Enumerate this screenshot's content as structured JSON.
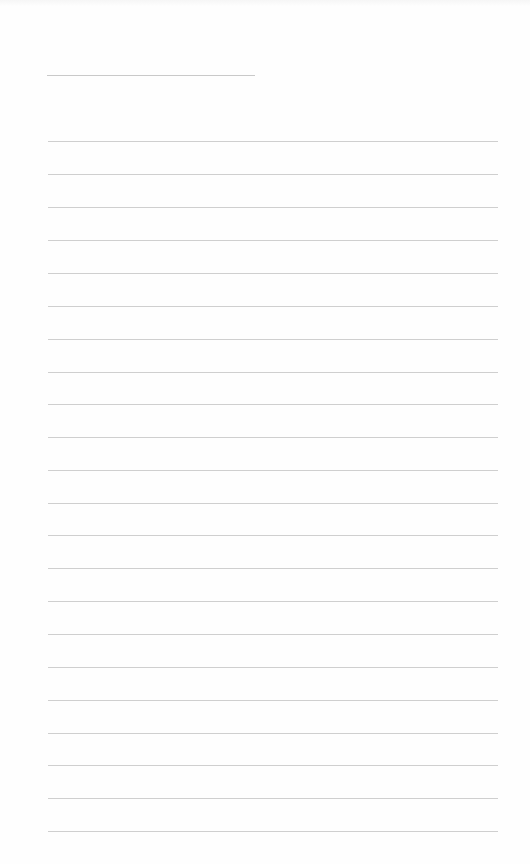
{
  "page": {
    "type": "lined-notebook-page",
    "background_color": "#fefefe",
    "line_color": "#cfcfcf",
    "title_line": {
      "x": 47,
      "y": 75,
      "width": 208
    },
    "rules": {
      "x": 48,
      "width": 450,
      "y_positions": [
        141,
        174,
        207,
        240,
        273,
        306,
        339,
        372,
        404,
        437,
        470,
        503,
        535,
        568,
        601,
        634,
        667,
        700,
        733,
        765,
        798,
        831
      ]
    }
  }
}
